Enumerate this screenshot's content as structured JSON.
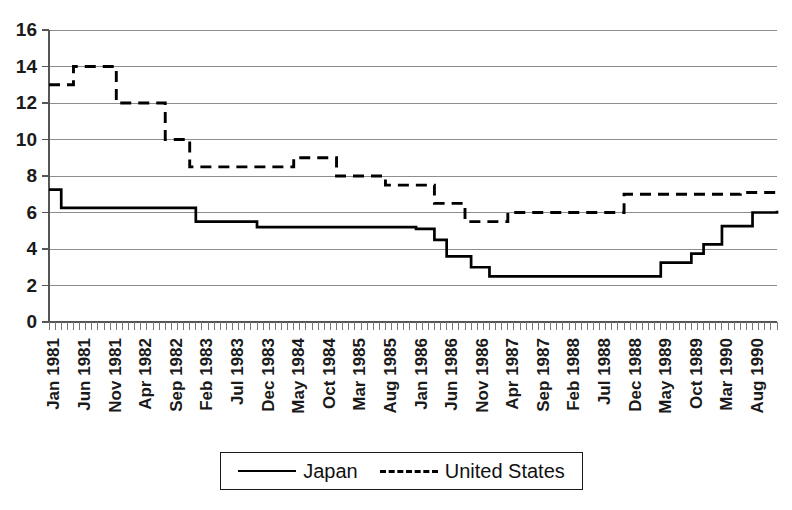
{
  "chart_data": {
    "type": "line",
    "title": "",
    "subtitle": "",
    "xlabel": "",
    "ylabel": "",
    "ylim": [
      0,
      16
    ],
    "ytick_values": [
      0,
      2,
      4,
      6,
      8,
      10,
      12,
      14,
      16
    ],
    "ytick_labels": [
      "0",
      "2",
      "4",
      "6",
      "8",
      "10",
      "12",
      "14",
      "16"
    ],
    "grid": true,
    "grid_axis": "y",
    "legend_position": "bottom",
    "x_tick_interval_months": 5,
    "x_start": "Jan 1981",
    "x_end": "Dec 1990",
    "xtick_labels": [
      "Jan 1981",
      "Jun 1981",
      "Nov 1981",
      "Apr 1982",
      "Sep 1982",
      "Feb 1983",
      "Jul 1983",
      "Dec 1983",
      "May 1984",
      "Oct 1984",
      "Mar 1985",
      "Aug 1985",
      "Jan 1986",
      "Jun 1986",
      "Nov 1986",
      "Apr 1987",
      "Sep 1987",
      "Feb 1988",
      "Jul 1988",
      "Dec 1988",
      "May 1989",
      "Oct 1989",
      "Mar 1990",
      "Aug 1990"
    ],
    "series": [
      {
        "name": "Japan",
        "style": "solid",
        "color": "#000000",
        "values": [
          7.25,
          7.25,
          6.25,
          6.25,
          6.25,
          6.25,
          6.25,
          6.25,
          6.25,
          6.25,
          6.25,
          6.25,
          6.25,
          6.25,
          6.25,
          6.25,
          6.25,
          6.25,
          6.25,
          6.25,
          6.25,
          6.25,
          6.25,
          6.25,
          5.5,
          5.5,
          5.5,
          5.5,
          5.5,
          5.5,
          5.5,
          5.5,
          5.5,
          5.5,
          5.5,
          5.5,
          5.5,
          5.5,
          5.5,
          5.5,
          5.5,
          5.5,
          5.5,
          5.5,
          5.5,
          5.5,
          5.5,
          5.5,
          5.2,
          5.2,
          5.2,
          5.2,
          5.2,
          5.2,
          5.2,
          5.2,
          5.2,
          5.2,
          5.2,
          5.2,
          5.2,
          5.2,
          5.2,
          5.2,
          5.2,
          5.2,
          5.2,
          5.2,
          5.2,
          5.2,
          5.2,
          5.2,
          5.1,
          5.1,
          5.1,
          5.1,
          5.1,
          5.1,
          5.1,
          5.1,
          5.1,
          5.1,
          5.1,
          5.1,
          5.1,
          5.1,
          5.1,
          5.1,
          5.1,
          5.1,
          5.1,
          5.1,
          5.1,
          5.1,
          5.1,
          5.1,
          5.1,
          5.1,
          5.1,
          5.1,
          5.1,
          5.1,
          5.1,
          5.1,
          5.1,
          5.1,
          5.1,
          5.1,
          5.1,
          5.1,
          5.1,
          5.1,
          5.1,
          5.1,
          5.1,
          5.1,
          5.1,
          5.1,
          5.1,
          5.1
        ]
      },
      {
        "name": "United States",
        "style": "dashed",
        "color": "#000000",
        "values": [
          13.0,
          13.0,
          13.0,
          13.0,
          14.0,
          14.0,
          14.0,
          14.0,
          14.0,
          14.0,
          14.0,
          12.0
        ]
      }
    ],
    "series_detailed": {
      "Japan": [
        {
          "x": "Jan 1981",
          "y": 7.25
        },
        {
          "x": "Feb 1981",
          "y": 7.25
        },
        {
          "x": "Mar 1981",
          "y": 6.25
        },
        {
          "x": "Dec 1982",
          "y": 6.25
        },
        {
          "x": "Jan 1983",
          "y": 5.5
        },
        {
          "x": "Oct 1983",
          "y": 5.5
        },
        {
          "x": "Nov 1983",
          "y": 5.2
        },
        {
          "x": "Dec 1985",
          "y": 5.2
        },
        {
          "x": "Jan 1986",
          "y": 5.1
        },
        {
          "x": "Mar 1986",
          "y": 5.1
        },
        {
          "x": "Apr 1986",
          "y": 4.5
        },
        {
          "x": "May 1986",
          "y": 4.5
        },
        {
          "x": "Jun 1986",
          "y": 3.6
        },
        {
          "x": "Sep 1986",
          "y": 3.6
        },
        {
          "x": "Oct 1986",
          "y": 3.0
        },
        {
          "x": "Dec 1986",
          "y": 3.0
        },
        {
          "x": "Jan 1987",
          "y": 2.5
        },
        {
          "x": "Apr 1989",
          "y": 2.5
        },
        {
          "x": "May 1989",
          "y": 3.25
        },
        {
          "x": "Sep 1989",
          "y": 3.25
        },
        {
          "x": "Oct 1989",
          "y": 3.75
        },
        {
          "x": "Nov 1989",
          "y": 3.75
        },
        {
          "x": "Dec 1989",
          "y": 4.25
        },
        {
          "x": "Feb 1990",
          "y": 4.25
        },
        {
          "x": "Mar 1990",
          "y": 5.25
        },
        {
          "x": "Jul 1990",
          "y": 5.25
        },
        {
          "x": "Aug 1990",
          "y": 6.0
        },
        {
          "x": "Dec 1990",
          "y": 6.1
        }
      ],
      "United States": [
        {
          "x": "Jan 1981",
          "y": 13.0
        },
        {
          "x": "Mar 1981",
          "y": 13.0
        },
        {
          "x": "May 1981",
          "y": 14.0
        },
        {
          "x": "Oct 1981",
          "y": 14.0
        },
        {
          "x": "Dec 1981",
          "y": 12.0
        },
        {
          "x": "May 1982",
          "y": 12.0
        },
        {
          "x": "Aug 1982",
          "y": 10.0
        },
        {
          "x": "Dec 1982",
          "y": 8.5
        },
        {
          "x": "Mar 1984",
          "y": 8.5
        },
        {
          "x": "May 1984",
          "y": 9.0
        },
        {
          "x": "Oct 1984",
          "y": 9.0
        },
        {
          "x": "Dec 1984",
          "y": 8.0
        },
        {
          "x": "Jun 1985",
          "y": 8.0
        },
        {
          "x": "Aug 1985",
          "y": 7.5
        },
        {
          "x": "Feb 1986",
          "y": 7.5
        },
        {
          "x": "Apr 1986",
          "y": 6.5
        },
        {
          "x": "Jul 1986",
          "y": 6.5
        },
        {
          "x": "Sep 1986",
          "y": 5.5
        },
        {
          "x": "Mar 1987",
          "y": 5.5
        },
        {
          "x": "Apr 1987",
          "y": 6.0
        },
        {
          "x": "Sep 1988",
          "y": 6.0
        },
        {
          "x": "Nov 1988",
          "y": 7.0
        },
        {
          "x": "Jun 1990",
          "y": 7.1
        },
        {
          "x": "Dec 1990",
          "y": 7.1
        }
      ]
    }
  },
  "legend": {
    "entries": [
      {
        "label": "Japan",
        "style": "solid"
      },
      {
        "label": "United States",
        "style": "dashed"
      }
    ]
  }
}
